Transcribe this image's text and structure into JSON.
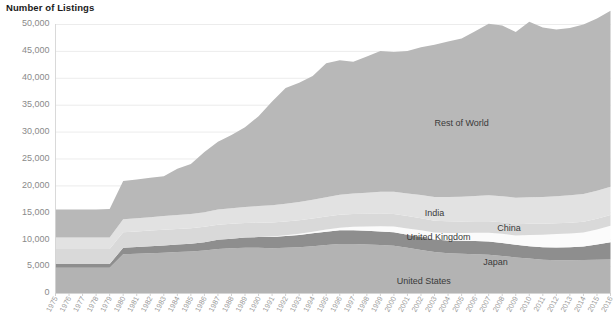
{
  "chart_title": "Number of Listings",
  "chart_data": {
    "type": "area",
    "stacked": true,
    "title": "Number of Listings",
    "xlabel": "",
    "ylabel": "Number of Listings",
    "ylim": [
      0,
      50000
    ],
    "ytick_step": 5000,
    "grid": true,
    "legend_position": "inline-labels",
    "ytick_labels": [
      "0",
      "5,000",
      "10,000",
      "15,000",
      "20,000",
      "25,000",
      "30,000",
      "35,000",
      "40,000",
      "45,000",
      "50,000"
    ],
    "ytick_values": [
      0,
      5000,
      10000,
      15000,
      20000,
      25000,
      30000,
      35000,
      40000,
      45000,
      50000
    ],
    "x": [
      1975,
      1976,
      1977,
      1978,
      1979,
      1980,
      1981,
      1982,
      1983,
      1984,
      1985,
      1986,
      1987,
      1988,
      1989,
      1990,
      1991,
      1992,
      1993,
      1994,
      1995,
      1996,
      1997,
      1998,
      1999,
      2000,
      2001,
      2002,
      2003,
      2004,
      2005,
      2006,
      2007,
      2008,
      2009,
      2010,
      2011,
      2012,
      2013,
      2014,
      2015,
      2016
    ],
    "xtick_labels": [
      "1975",
      "1976",
      "1977",
      "1978",
      "1979",
      "1980",
      "1981",
      "1982",
      "1983",
      "1984",
      "1985",
      "1986",
      "1987",
      "1988",
      "1989",
      "1990",
      "1991",
      "1992",
      "1993",
      "1994",
      "1995",
      "1996",
      "1997",
      "1998",
      "1999",
      "2000",
      "2001",
      "2002",
      "2003",
      "2004",
      "2005",
      "2006",
      "2007",
      "2008",
      "2009",
      "2010",
      "2011",
      "2012",
      "2013",
      "2014",
      "2015",
      "2016"
    ],
    "series": [
      {
        "name": "United States",
        "color": "#b3b3b3",
        "label_position": {
          "x": 2002.2,
          "y": 2100
        },
        "values": [
          4700,
          4700,
          4700,
          4700,
          4700,
          7200,
          7300,
          7400,
          7500,
          7600,
          7700,
          7900,
          8200,
          8300,
          8400,
          8400,
          8300,
          8400,
          8500,
          8700,
          8900,
          9100,
          9100,
          9000,
          8900,
          8800,
          8400,
          8000,
          7600,
          7400,
          7300,
          7200,
          7100,
          6900,
          6600,
          6400,
          6200,
          6100,
          6100,
          6150,
          6200,
          6250
        ]
      },
      {
        "name": "Japan",
        "color": "#8e8e8e",
        "label_position": {
          "x": 2007.5,
          "y": 5600
        },
        "values": [
          700,
          700,
          700,
          700,
          700,
          1200,
          1250,
          1300,
          1350,
          1400,
          1450,
          1550,
          1700,
          1800,
          1900,
          2000,
          2100,
          2200,
          2300,
          2400,
          2500,
          2550,
          2550,
          2550,
          2550,
          2500,
          2450,
          2400,
          2350,
          2350,
          2400,
          2450,
          2450,
          2400,
          2350,
          2300,
          2300,
          2350,
          2400,
          2500,
          2800,
          3200
        ]
      },
      {
        "name": "China",
        "color": "#fbfbfb",
        "label_position": {
          "x": 2008.5,
          "y": 11900
        },
        "values": [
          0,
          0,
          0,
          0,
          0,
          0,
          0,
          0,
          0,
          0,
          0,
          0,
          0,
          0,
          0,
          0,
          100,
          150,
          200,
          300,
          400,
          500,
          650,
          800,
          950,
          1050,
          1150,
          1250,
          1300,
          1400,
          1450,
          1550,
          1650,
          1700,
          1750,
          2100,
          2350,
          2500,
          2550,
          2600,
          2800,
          3050
        ]
      },
      {
        "name": "United Kingdom",
        "color": "#d9d9d9",
        "label_position": {
          "x": 2003.3,
          "y": 10350
        },
        "values": [
          2800,
          2800,
          2800,
          2800,
          2800,
          2900,
          2900,
          2900,
          2900,
          2900,
          2900,
          2850,
          2800,
          2750,
          2700,
          2650,
          2600,
          2550,
          2500,
          2450,
          2400,
          2400,
          2400,
          2400,
          2400,
          2350,
          2300,
          2250,
          2200,
          2200,
          2150,
          2150,
          2150,
          2150,
          2100,
          2050,
          2000,
          2000,
          2000,
          2000,
          2000,
          2000
        ]
      },
      {
        "name": "India",
        "color": "#e2e2e2",
        "label_position": {
          "x": 2003.0,
          "y": 14800
        },
        "values": [
          2100,
          2100,
          2100,
          2100,
          2100,
          2400,
          2450,
          2500,
          2550,
          2600,
          2650,
          2700,
          2800,
          2900,
          3000,
          3100,
          3200,
          3300,
          3400,
          3500,
          3600,
          3700,
          3800,
          3900,
          4000,
          4100,
          4200,
          4300,
          4400,
          4500,
          4600,
          4700,
          4800,
          4850,
          4900,
          4950,
          5000,
          5050,
          5100,
          5150,
          5200,
          5250
        ]
      },
      {
        "name": "Rest of World",
        "color": "#b8b8b8",
        "label_position": {
          "x": 2005.0,
          "y": 31500
        },
        "values": [
          5200,
          5200,
          5200,
          5200,
          5300,
          7100,
          7200,
          7300,
          7400,
          8600,
          9300,
          11200,
          12600,
          13600,
          14800,
          16700,
          19300,
          21500,
          22200,
          23000,
          24900,
          25000,
          24500,
          25300,
          26200,
          26000,
          26500,
          27500,
          28300,
          28900,
          29400,
          30600,
          31900,
          31700,
          30800,
          32600,
          31500,
          31000,
          31100,
          31500,
          32000,
          32700
        ]
      }
    ],
    "totals": [
      15500,
      15500,
      15500,
      15500,
      15600,
      20800,
      21100,
      21400,
      21700,
      23100,
      24000,
      26200,
      28100,
      29350,
      30800,
      32850,
      35600,
      38100,
      39100,
      40350,
      42700,
      43250,
      43000,
      43950,
      45000,
      44800,
      45000,
      45700,
      46150,
      46750,
      47300,
      48650,
      50050,
      49700,
      48500,
      50400,
      49350,
      49000,
      49250,
      49900,
      51000,
      52450
    ]
  }
}
